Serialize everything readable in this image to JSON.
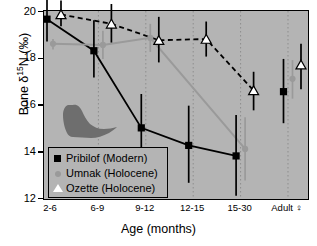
{
  "chart_data": {
    "type": "line",
    "title": "",
    "xlabel": "Age (months)",
    "ylabel": "Bone δ¹⁵N (‰)",
    "categories": [
      "2-6",
      "6-9",
      "9-12",
      "12-15",
      "15-30",
      "Adult ♀"
    ],
    "ylim": [
      12,
      20
    ],
    "yticks": [
      12,
      14,
      16,
      18,
      20
    ],
    "grid": "vertical-dotted",
    "legend_position": "lower-left-inside",
    "series": [
      {
        "name": "Pribilof (Modern)",
        "marker": "filled-square",
        "color": "#000000",
        "linestyle": "solid",
        "values": [
          19.65,
          18.3,
          15.0,
          14.25,
          13.8,
          16.55
        ],
        "err_low": [
          18.7,
          17.15,
          13.45,
          12.65,
          12.1,
          15.2
        ],
        "err_high": [
          20.5,
          19.6,
          16.45,
          15.95,
          15.55,
          17.95
        ]
      },
      {
        "name": "Umnak (Holocene)",
        "marker": "filled-circle",
        "color": "#9a9a9a",
        "linestyle": "solid",
        "values": [
          18.6,
          18.55,
          18.85,
          null,
          14.1,
          17.1
        ],
        "err_low": [
          18.35,
          17.95,
          18.25,
          null,
          12.75,
          16.25
        ],
        "err_high": [
          18.8,
          19.15,
          19.45,
          null,
          15.45,
          17.9
        ]
      },
      {
        "name": "Ozette (Holocene)",
        "marker": "open-triangle",
        "color": "#000000",
        "linestyle": "dashed",
        "values": [
          19.85,
          19.45,
          18.75,
          18.8,
          16.6,
          17.7
        ],
        "err_low": [
          19.35,
          18.65,
          17.8,
          18.05,
          15.75,
          16.65
        ],
        "err_high": [
          20.45,
          20.3,
          19.75,
          19.55,
          17.4,
          18.6
        ]
      }
    ],
    "annotations": [
      {
        "name": "fur-seal-silhouette",
        "type": "image-glyph",
        "color": "#6e6e6e"
      }
    ]
  },
  "axis": {
    "ytick_labels": [
      "20",
      "18",
      "16",
      "14",
      "12"
    ],
    "ylabel_main": "Bone δ",
    "ylabel_sup": "15",
    "ylabel_tail": "N (‰)",
    "xtitle": "Age (months)"
  },
  "legend": {
    "items": [
      {
        "label": "Pribilof (Modern)",
        "symbol": "filled-square"
      },
      {
        "label": "Umnak (Holocene)",
        "symbol": "filled-circle"
      },
      {
        "label": "Ozette (Holocene)",
        "symbol": "open-triangle"
      }
    ]
  },
  "colors": {
    "plot_background": "#b4b4b4",
    "page_background": "#ffffff",
    "pribilof": "#000000",
    "umnak": "#9a9a9a",
    "ozette": "#000000",
    "grid": "#8d8d8d"
  }
}
